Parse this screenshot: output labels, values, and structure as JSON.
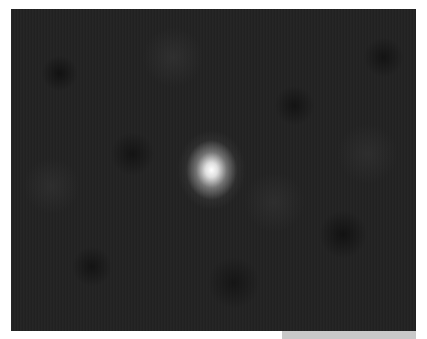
{
  "image": {
    "description": "Dark noisy field with a single bright point source near center",
    "background_color": "#222222",
    "source_color": "#ffffff",
    "source_center": [
      213,
      172
    ],
    "footer_bar_color": "#c8c8c8"
  }
}
